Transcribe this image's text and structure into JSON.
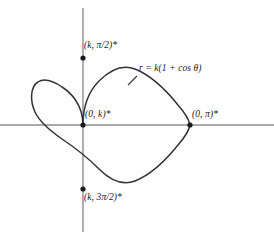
{
  "figure": {
    "background_color": "#fefefe",
    "curve_color": "#333333",
    "axis_color": "#8c8c8c",
    "point_color": "#1a1a1a",
    "text_color": "#1a1a1a"
  },
  "axes": {
    "horizontal": {
      "name": "polar-axis",
      "y": 125,
      "x_start": 0,
      "x_end": 274
    },
    "vertical": {
      "name": "vertical-axis",
      "x": 83,
      "y_start": 8,
      "y_end": 232
    },
    "origin": {
      "x": 83,
      "y": 125
    }
  },
  "labels": {
    "top": {
      "text": "(k, π/2)*",
      "coord_x": 83,
      "coord_y": 58
    },
    "origin": {
      "text": "(0, k)*",
      "coord_x": 83,
      "coord_y": 125
    },
    "right": {
      "text": "(0, π)*",
      "coord_x": 190,
      "coord_y": 125
    },
    "bottom": {
      "text": "(k, 3π/2)*",
      "coord_x": 83,
      "coord_y": 189
    },
    "equation": {
      "text": "r = k(1 + cos θ)"
    }
  },
  "points": [
    {
      "name": "point-top",
      "label": "(k, π/2)*",
      "x": 83,
      "y": 58
    },
    {
      "name": "point-cusp",
      "label": "(0, k)*",
      "x": 83,
      "y": 125
    },
    {
      "name": "point-right",
      "label": "(0, π)*",
      "x": 190,
      "y": 125
    },
    {
      "name": "point-bottom",
      "label": "(k, 3π/2)*",
      "x": 83,
      "y": 189
    }
  ],
  "chart_data": {
    "type": "line",
    "title": "",
    "subtitle": "",
    "xlabel": "",
    "ylabel": "",
    "grid": false,
    "legend": null,
    "polar": true,
    "equation": "r = k(1 + cos θ)",
    "curve_name": "cardioid",
    "orientation": "opens-left (cusp at origin on the right side of the loop, maximum extent toward negative x)",
    "parameter_k_pixels": 53.5,
    "axis_ranges": {
      "x": [
        0,
        274
      ],
      "y": [
        0,
        241
      ]
    },
    "annotations": [
      {
        "text": "(k, π/2)*",
        "x": 83,
        "y": 58,
        "note": "theta = pi/2, r = k"
      },
      {
        "text": "(0, k)*",
        "x": 83,
        "y": 125,
        "note": "cusp at pole"
      },
      {
        "text": "(0, π)*",
        "x": 190,
        "y": 125,
        "note": "theta = pi"
      },
      {
        "text": "(k, 3π/2)*",
        "x": 83,
        "y": 189,
        "note": "theta = 3pi/2, r = k"
      },
      {
        "text": "r = k(1 + cos θ)",
        "x": 139,
        "y": 70,
        "note": "curve equation label"
      }
    ],
    "theta_deg": [
      0,
      15,
      30,
      45,
      60,
      75,
      90,
      105,
      120,
      135,
      150,
      165,
      180,
      195,
      210,
      225,
      240,
      255,
      270,
      285,
      300,
      315,
      330,
      345,
      360
    ],
    "r_over_k": [
      2.0,
      1.966,
      1.866,
      1.707,
      1.5,
      1.259,
      1.0,
      0.741,
      0.5,
      0.293,
      0.134,
      0.034,
      0.0,
      0.034,
      0.134,
      0.293,
      0.5,
      0.741,
      1.0,
      1.259,
      1.5,
      1.707,
      1.866,
      1.966,
      2.0
    ]
  }
}
